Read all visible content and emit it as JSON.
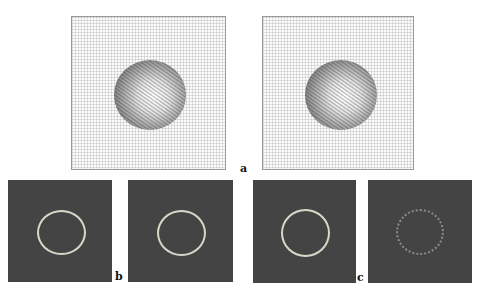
{
  "figure": {
    "labels": {
      "a": "a",
      "b": "b",
      "c": "c"
    },
    "panels_top": [
      {
        "id": "a-left",
        "content": "vector-field-sphere"
      },
      {
        "id": "a-right",
        "content": "vector-field-sphere"
      }
    ],
    "panels_bottom": [
      {
        "id": "b-left",
        "content": "circle-edge"
      },
      {
        "id": "b-right",
        "content": "circle-edge"
      },
      {
        "id": "c-left",
        "content": "circle-edge"
      },
      {
        "id": "c-right",
        "content": "circle-edge-faint"
      }
    ],
    "colors": {
      "top_panel_bg": "#fbfbfb",
      "bottom_panel_bg": "#3d3d3d",
      "ring": "#d8d8c8"
    }
  }
}
